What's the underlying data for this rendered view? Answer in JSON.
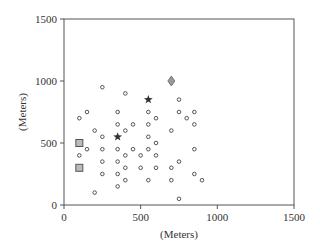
{
  "chart_data": {
    "type": "scatter",
    "title": "",
    "xlabel": "(Meters)",
    "ylabel": "(Meters)",
    "xlim": [
      0,
      1500
    ],
    "ylim": [
      0,
      1500
    ],
    "xticks": [
      0,
      500,
      1000,
      1500
    ],
    "yticks": [
      0,
      500,
      1000,
      1500
    ],
    "grid": false,
    "legend": null,
    "series": [
      {
        "name": "circles",
        "marker": "circle-open",
        "color": "#444444",
        "points": [
          [
            250,
            950
          ],
          [
            400,
            900
          ],
          [
            750,
            850
          ],
          [
            150,
            750
          ],
          [
            350,
            750
          ],
          [
            550,
            750
          ],
          [
            750,
            750
          ],
          [
            850,
            750
          ],
          [
            100,
            700
          ],
          [
            600,
            700
          ],
          [
            800,
            700
          ],
          [
            350,
            650
          ],
          [
            450,
            650
          ],
          [
            550,
            650
          ],
          [
            850,
            650
          ],
          [
            200,
            600
          ],
          [
            400,
            600
          ],
          [
            700,
            600
          ],
          [
            250,
            550
          ],
          [
            550,
            550
          ],
          [
            600,
            500
          ],
          [
            150,
            450
          ],
          [
            250,
            450
          ],
          [
            350,
            450
          ],
          [
            450,
            450
          ],
          [
            550,
            450
          ],
          [
            850,
            450
          ],
          [
            100,
            400
          ],
          [
            400,
            400
          ],
          [
            500,
            400
          ],
          [
            600,
            400
          ],
          [
            250,
            350
          ],
          [
            350,
            350
          ],
          [
            750,
            350
          ],
          [
            400,
            300
          ],
          [
            500,
            300
          ],
          [
            600,
            300
          ],
          [
            700,
            300
          ],
          [
            250,
            250
          ],
          [
            350,
            250
          ],
          [
            850,
            250
          ],
          [
            400,
            200
          ],
          [
            550,
            200
          ],
          [
            700,
            200
          ],
          [
            900,
            200
          ],
          [
            350,
            150
          ],
          [
            200,
            100
          ],
          [
            750,
            50
          ]
        ]
      },
      {
        "name": "stars",
        "marker": "star",
        "color": "#333333",
        "points": [
          [
            350,
            550
          ],
          [
            550,
            850
          ]
        ]
      },
      {
        "name": "squares",
        "marker": "square",
        "color": "#bbbbbb",
        "edge": "#555555",
        "points": [
          [
            100,
            500
          ],
          [
            100,
            300
          ]
        ]
      },
      {
        "name": "diamond",
        "marker": "diamond",
        "color": "#999999",
        "edge": "#666666",
        "points": [
          [
            700,
            1000
          ]
        ]
      }
    ]
  },
  "axes": {
    "x_label": "(Meters)",
    "y_label": "(Meters)",
    "x_tick_labels": [
      "0",
      "500",
      "1000",
      "1500"
    ],
    "y_tick_labels": [
      "0",
      "500",
      "1000",
      "1500"
    ]
  }
}
